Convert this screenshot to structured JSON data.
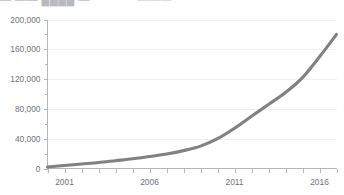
{
  "header": {
    "clipped_title_left": "— —— ████ —",
    "clipped_title_right": "———"
  },
  "chart_data": {
    "type": "line",
    "title": "",
    "xlabel": "",
    "ylabel": "",
    "xlim": [
      2000,
      2017
    ],
    "ylim": [
      0,
      200000
    ],
    "grid": true,
    "legend": "none",
    "line_color": "#808085",
    "grid_color": "#f0f0f2",
    "axis_color": "#b6b6bb",
    "label_color": "#70707a",
    "y_ticks": [
      0,
      40000,
      80000,
      120000,
      160000,
      200000
    ],
    "y_tick_labels": [
      "0",
      "40,000",
      "80,000",
      "120,000",
      "160,000",
      "200,000"
    ],
    "y_minor_ticks": [
      20000,
      60000,
      100000,
      140000,
      180000
    ],
    "x_ticks": [
      2000,
      2001,
      2002,
      2003,
      2004,
      2005,
      2006,
      2007,
      2008,
      2009,
      2010,
      2011,
      2012,
      2013,
      2014,
      2015,
      2016,
      2017
    ],
    "x_tick_labels": [
      "2001",
      "2006",
      "2011",
      "2016"
    ],
    "x_labeled_ticks": [
      2001,
      2006,
      2011,
      2016
    ],
    "series": [
      {
        "name": "series-1",
        "x": [
          2000,
          2001,
          2002,
          2003,
          2004,
          2005,
          2006,
          2007,
          2008,
          2009,
          2010,
          2011,
          2012,
          2013,
          2014,
          2015,
          2016,
          2017
        ],
        "values": [
          2000,
          4000,
          6000,
          8000,
          10500,
          13000,
          16000,
          19500,
          24000,
          30000,
          40000,
          54000,
          70000,
          86000,
          102000,
          122000,
          150000,
          180000
        ]
      }
    ]
  }
}
